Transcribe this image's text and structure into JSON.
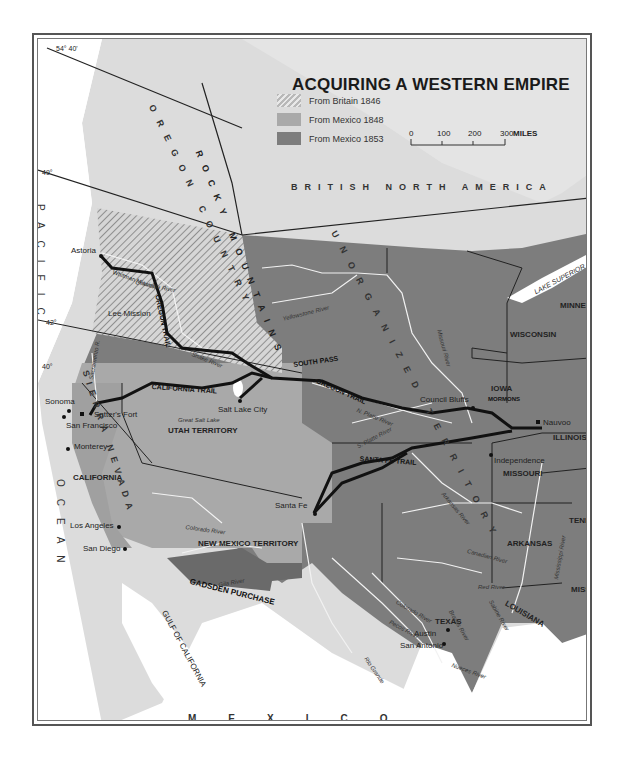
{
  "title": "ACQUIRING A WESTERN EMPIRE",
  "legend": {
    "items": [
      {
        "label": "From Britain 1846",
        "pattern": "hatched",
        "color": "#c8c8c8"
      },
      {
        "label": "From Mexico 1848",
        "color": "#a9a9a9"
      },
      {
        "label": "From Mexico 1853",
        "color": "#7d7d7d"
      }
    ]
  },
  "scale": {
    "ticks": [
      "0",
      "100",
      "200",
      "300"
    ],
    "unit": "MILES"
  },
  "latitudes": [
    "54° 40'",
    "49°",
    "42°",
    "40°"
  ],
  "regions": {
    "british_north_america": "BRITISH NORTH AMERICA",
    "oregon_country": "OREGON COUNTRY",
    "unorganized_territory": "UNORGANIZED TERRITORY",
    "rocky_mountains": "ROCKY MOUNTAINS",
    "sierra_nevada": "SIERRA NEVADA",
    "mexico": "MEXICO",
    "pacific_ocean": [
      "PACIFIC",
      "OCEAN"
    ]
  },
  "territories": [
    "MINNESOTA TERRITORY",
    "WISCONSIN",
    "IOWA",
    "ILLINOIS",
    "MISSOURI",
    "TENN.",
    "ARKANSAS",
    "MISS.",
    "LOUISIANA",
    "TEXAS",
    "UTAH TERRITORY",
    "NEW MEXICO TERRITORY",
    "CALIFORNIA",
    "GADSDEN PURCHASE"
  ],
  "cities": [
    "Astoria",
    "Lee Mission",
    "Whitman Mission",
    "Sonoma",
    "Sutter's Fort",
    "San Francisco",
    "Monterey",
    "Los Angeles",
    "San Diego",
    "Salt Lake City",
    "Santa Fe",
    "Council Bluffs",
    "Nauvoo",
    "Independence",
    "Austin",
    "San Antonio"
  ],
  "trails": [
    "OREGON TRAIL",
    "CALIFORNIA TRAIL",
    "SANTA FE TRAIL",
    "MORMONS"
  ],
  "rivers": [
    "Columbia River",
    "Snake River",
    "Yellowstone River",
    "Missouri River",
    "N. Platte River",
    "S. Platte River",
    "Arkansas River",
    "Canadian River",
    "Red River",
    "Colorado River",
    "Gila River",
    "Rio Grande",
    "Pecos River",
    "Brazos River",
    "Sabine River",
    "Mississippi River",
    "Nueces River",
    "Sacramento R."
  ],
  "water": {
    "lake_superior": "LAKE SUPERIOR",
    "great_salt_lake": "Great Salt Lake",
    "gulf_of_california": "GULF OF CALIFORNIA",
    "gulf_of_mexico": "GULF OF MEXICO"
  }
}
